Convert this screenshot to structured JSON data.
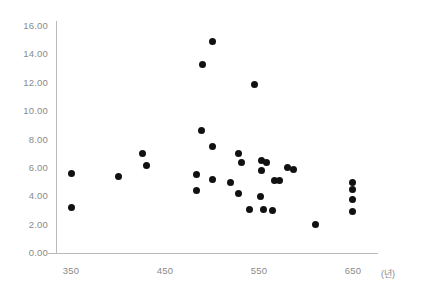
{
  "chart_data": {
    "type": "scatter",
    "title": "",
    "xlabel": "(년)",
    "ylabel": "",
    "xlim": [
      330,
      680
    ],
    "ylim": [
      0,
      16
    ],
    "grid": false,
    "legend": null,
    "xticks": [
      "350",
      "450",
      "550",
      "650"
    ],
    "xtick_values": [
      350,
      450,
      550,
      650
    ],
    "yticks": [
      "0.00",
      "2.00",
      "4.00",
      "6.00",
      "8.00",
      "10.00",
      "12.00",
      "14.00",
      "16.00"
    ],
    "ytick_values": [
      0,
      2,
      4,
      6,
      8,
      10,
      12,
      14,
      16
    ],
    "marker_color": "#111111",
    "axis_color": "#b9b9b9",
    "tick_label_color": "#8a8a8a",
    "points": [
      {
        "x": 501,
        "y": 14.9
      },
      {
        "x": 490,
        "y": 13.3
      },
      {
        "x": 545,
        "y": 11.9
      },
      {
        "x": 489,
        "y": 8.6
      },
      {
        "x": 500,
        "y": 7.5
      },
      {
        "x": 426,
        "y": 7.0
      },
      {
        "x": 528,
        "y": 7.0
      },
      {
        "x": 531,
        "y": 6.4
      },
      {
        "x": 430,
        "y": 6.2
      },
      {
        "x": 553,
        "y": 6.5
      },
      {
        "x": 558,
        "y": 6.4
      },
      {
        "x": 580,
        "y": 6.0
      },
      {
        "x": 587,
        "y": 5.9
      },
      {
        "x": 553,
        "y": 5.8
      },
      {
        "x": 484,
        "y": 5.5
      },
      {
        "x": 351,
        "y": 5.6
      },
      {
        "x": 400,
        "y": 5.4
      },
      {
        "x": 500,
        "y": 5.2
      },
      {
        "x": 520,
        "y": 5.0
      },
      {
        "x": 566,
        "y": 5.1
      },
      {
        "x": 572,
        "y": 5.1
      },
      {
        "x": 649,
        "y": 5.0
      },
      {
        "x": 649,
        "y": 4.5
      },
      {
        "x": 649,
        "y": 3.8
      },
      {
        "x": 649,
        "y": 2.9
      },
      {
        "x": 484,
        "y": 4.4
      },
      {
        "x": 528,
        "y": 4.2
      },
      {
        "x": 552,
        "y": 4.0
      },
      {
        "x": 555,
        "y": 3.1
      },
      {
        "x": 564,
        "y": 3.0
      },
      {
        "x": 540,
        "y": 3.1
      },
      {
        "x": 350,
        "y": 3.2
      },
      {
        "x": 610,
        "y": 2.0
      }
    ]
  }
}
